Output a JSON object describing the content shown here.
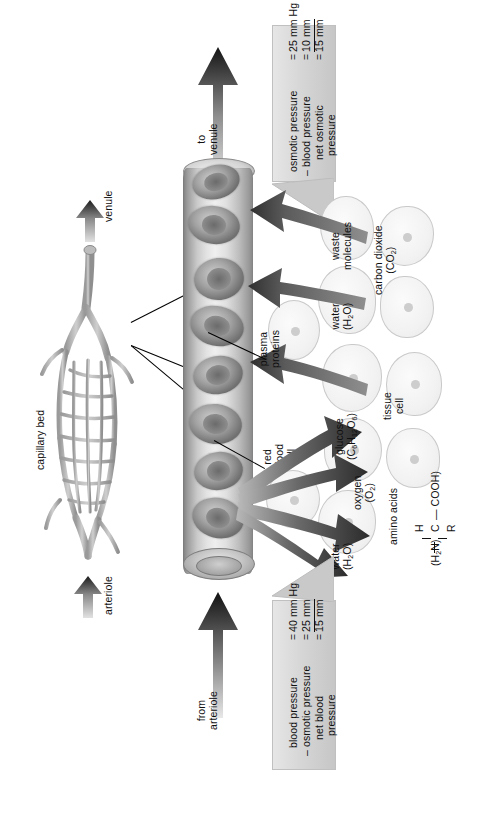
{
  "figure": {
    "orientation": "rotated-90-ccw"
  },
  "flow_labels": {
    "to_venule_line1": "to",
    "to_venule_line2": "venule",
    "from_arteriole_line1": "from",
    "from_arteriole_line2": "arteriole"
  },
  "bed": {
    "bed_label": "capillary bed",
    "venule_label": "venule",
    "arteriole_label": "arteriole"
  },
  "blood_labels": {
    "plasma_proteins_line1": "plasma",
    "plasma_proteins_line2": "proteins",
    "red_blood_cell_line1": "red",
    "red_blood_cell_line2": "blood",
    "red_blood_cell_line3": "cell"
  },
  "tissue": {
    "tissue_cell_line1": "tissue",
    "tissue_cell_line2": "cell"
  },
  "inbound_substances": [
    {
      "name_line1": "waste",
      "name_line2": "molecules",
      "formula": ""
    },
    {
      "name_line1": "carbon dioxide",
      "name_line2": "",
      "formula": "(CO2)"
    },
    {
      "name_line1": "water",
      "name_line2": "",
      "formula": "(H2O)"
    }
  ],
  "outbound_substances": [
    {
      "name_line1": "glucose",
      "name_line2": "",
      "formula": "(C6H12O6)"
    },
    {
      "name_line1": "oxygen",
      "name_line2": "",
      "formula": "(O2)"
    },
    {
      "name_line1": "amino acids",
      "name_line2": "",
      "formula": ""
    },
    {
      "name_line1": "water",
      "name_line2": "",
      "formula": "(H2O)"
    }
  ],
  "amino_acid_formula": {
    "top": "H",
    "left": "(H2N)",
    "center": "C",
    "right": "COOH)",
    "bottom": "R"
  },
  "venous_end_pressure": {
    "row1_label": "osmotic pressure",
    "row1_eq": "=",
    "row1_value": "25 mm Hg",
    "row2_label": "– blood pressure",
    "row2_eq": "=",
    "row2_value": "10 mm",
    "row3_label_line1": "net osmotic",
    "row3_label_line2": "pressure",
    "row3_eq": "=",
    "row3_value": "15 mm"
  },
  "arterial_end_pressure": {
    "row1_label": "blood pressure",
    "row1_eq": "=",
    "row1_value": "40 mm Hg",
    "row2_label": "– osmotic pressure",
    "row2_eq": "=",
    "row2_value": "25 mm",
    "row3_label_line1": "net blood",
    "row3_label_line2": "pressure",
    "row3_eq": "=",
    "row3_value": "15 mm"
  },
  "colors": {
    "ink": "#101010",
    "banner_light": "#e6e6e6",
    "banner_dark": "#c6c6c6",
    "arrow_dark": "#3a3a3a",
    "arrow_mid": "#6e6e6e",
    "tube_light": "#efefef",
    "tube_dark": "#7e7e7e"
  }
}
